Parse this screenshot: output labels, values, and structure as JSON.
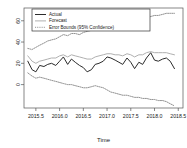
{
  "chart_data": {
    "type": "line",
    "title": "",
    "xlabel": "Time",
    "ylabel": "",
    "xlim": [
      2015.25,
      2018.6
    ],
    "ylim": [
      -22,
      72
    ],
    "grid": false,
    "legend_position": "top-left",
    "xticks": [
      "2015.5",
      "2016.0",
      "2016.5",
      "2017.0",
      "2017.5",
      "2018.0",
      "2018.5"
    ],
    "xtick_values": [
      2015.5,
      2016.0,
      2016.5,
      2017.0,
      2017.5,
      2018.0,
      2018.5
    ],
    "yticks": [
      "60",
      "40",
      "20",
      "0"
    ],
    "ytick_values": [
      60,
      40,
      20,
      0
    ],
    "x": [
      2015.33,
      2015.42,
      2015.5,
      2015.58,
      2015.67,
      2015.75,
      2015.83,
      2015.92,
      2016.0,
      2016.08,
      2016.17,
      2016.25,
      2016.33,
      2016.42,
      2016.5,
      2016.58,
      2016.67,
      2016.75,
      2016.83,
      2016.92,
      2017.0,
      2017.08,
      2017.17,
      2017.25,
      2017.33,
      2017.42,
      2017.5,
      2017.58,
      2017.67,
      2017.75,
      2017.83,
      2017.92,
      2018.0,
      2018.08,
      2018.17,
      2018.25,
      2018.33,
      2018.42
    ],
    "series": [
      {
        "name": "Actual",
        "style": "solid",
        "color": "#2b2b2b",
        "values": [
          22,
          14,
          12,
          18,
          17,
          19,
          20,
          18,
          22,
          26,
          19,
          24,
          21,
          18,
          16,
          12,
          14,
          19,
          20,
          22,
          26,
          25,
          23,
          21,
          19,
          25,
          21,
          15,
          21,
          19,
          25,
          30,
          23,
          22,
          24,
          25,
          22,
          15
        ]
      },
      {
        "name": "Forecast",
        "style": "solid",
        "color": "#b0b0b0",
        "values": [
          27,
          22,
          20,
          22,
          23,
          24,
          25,
          25,
          27,
          28,
          26,
          28,
          27,
          26,
          25,
          24,
          24,
          26,
          27,
          28,
          29,
          29,
          28,
          28,
          27,
          29,
          28,
          26,
          28,
          28,
          30,
          31,
          30,
          30,
          30,
          30,
          29,
          28
        ]
      },
      {
        "name": "Error Bounds (95% Confidence)",
        "style": "dotted",
        "color": "#6e6e6e",
        "bound": "upper",
        "values": [
          34,
          33,
          35,
          37,
          39,
          41,
          42,
          43,
          45,
          47,
          46,
          48,
          48,
          47,
          49,
          50,
          51,
          52,
          53,
          54,
          55,
          56,
          56,
          57,
          58,
          59,
          60,
          60,
          61,
          62,
          63,
          64,
          65,
          65,
          66,
          67,
          67,
          67
        ]
      },
      {
        "name": "Error Bounds (95% Confidence)",
        "style": "dotted",
        "color": "#6e6e6e",
        "bound": "lower",
        "values": [
          11,
          8,
          6,
          7,
          6,
          5,
          4,
          3,
          2,
          1,
          0,
          0,
          -1,
          -2,
          -3,
          -3,
          -2,
          -1,
          -2,
          -3,
          -5,
          -7,
          -8,
          -9,
          -10,
          -10,
          -11,
          -12,
          -12,
          -13,
          -13,
          -14,
          -14,
          -15,
          -15,
          -16,
          -18,
          -20
        ]
      }
    ],
    "legend": [
      {
        "label": "Actual",
        "style": "solid",
        "color": "#2b2b2b"
      },
      {
        "label": "Forecast",
        "style": "solid",
        "color": "#b0b0b0"
      },
      {
        "label": "Error Bounds (95% Confidence)",
        "style": "dotted",
        "color": "#6e6e6e"
      }
    ]
  }
}
